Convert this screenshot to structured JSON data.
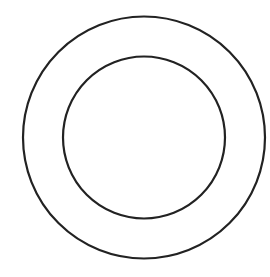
{
  "diagram": {
    "background": "#ffffff",
    "stroke_color": "#222222",
    "stroke_width": 2.2,
    "circles": [
      {
        "name": "outer-circle",
        "cx": 144,
        "cy": 137.5,
        "r": 121
      },
      {
        "name": "inner-circle",
        "cx": 144,
        "cy": 137.5,
        "r": 81
      }
    ]
  }
}
